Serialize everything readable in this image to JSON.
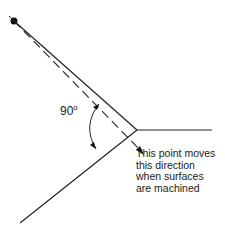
{
  "diagram": {
    "type": "geometry",
    "angle_label": {
      "value": "90",
      "unit": "o"
    },
    "note_lines": [
      "This point moves",
      "this direction",
      "when surfaces",
      "are machined"
    ],
    "colors": {
      "line": "#222222",
      "background": "#ffffff"
    }
  }
}
